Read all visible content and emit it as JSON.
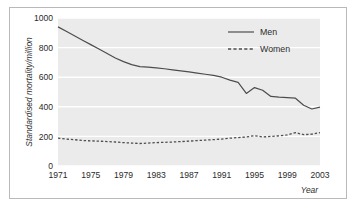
{
  "chart_data": {
    "type": "line",
    "title": "",
    "xlabel": "Year",
    "ylabel": "Standardised mortality/million",
    "xlim": [
      1971,
      2003
    ],
    "ylim": [
      0,
      1000
    ],
    "xticks": [
      1971,
      1975,
      1979,
      1983,
      1987,
      1991,
      1995,
      1999,
      2003
    ],
    "yticks": [
      0,
      200,
      400,
      600,
      800,
      1000
    ],
    "grid": "horizontal",
    "legend_position": "top-right",
    "plot_background": "#ebebeb",
    "gridline_color": "#ffffff",
    "line_color": "#4d4d4d",
    "x": [
      1971,
      1972,
      1973,
      1974,
      1975,
      1976,
      1977,
      1978,
      1979,
      1980,
      1981,
      1982,
      1983,
      1984,
      1985,
      1986,
      1987,
      1988,
      1989,
      1990,
      1991,
      1992,
      1993,
      1994,
      1995,
      1996,
      1997,
      1998,
      1999,
      2000,
      2001,
      2002,
      2003
    ],
    "series": [
      {
        "name": "Men",
        "style": "solid",
        "values": [
          940,
          910,
          880,
          850,
          820,
          790,
          760,
          730,
          705,
          685,
          672,
          668,
          663,
          657,
          650,
          643,
          636,
          628,
          620,
          612,
          600,
          580,
          565,
          490,
          530,
          512,
          470,
          465,
          462,
          458,
          410,
          385,
          398
        ]
      },
      {
        "name": "Women",
        "style": "dashed",
        "values": [
          188,
          182,
          178,
          172,
          170,
          168,
          165,
          162,
          158,
          155,
          152,
          155,
          158,
          160,
          162,
          165,
          168,
          172,
          175,
          178,
          182,
          188,
          192,
          196,
          205,
          196,
          200,
          204,
          210,
          225,
          212,
          215,
          225
        ]
      }
    ]
  },
  "legend": {
    "entries": [
      {
        "label": "Men",
        "style": "solid"
      },
      {
        "label": "Women",
        "style": "dashed"
      }
    ]
  },
  "axes": {
    "y_title": "Standardised mortality/million",
    "x_title": "Year"
  }
}
